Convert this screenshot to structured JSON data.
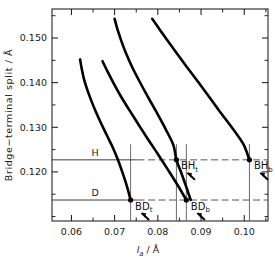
{
  "chart_data": {
    "type": "line",
    "title": "",
    "xlabel": "l_a / Å",
    "ylabel": "Bridge−terminal split / Å",
    "xlim": [
      0.0555,
      0.1055
    ],
    "ylim": [
      0.109,
      0.1565
    ],
    "grid": false,
    "legend": "none",
    "xticks": [
      0.06,
      0.07,
      0.08,
      0.09,
      0.1
    ],
    "xtick_labels": [
      "0.06",
      "0.07",
      "0.08",
      "0.09",
      "0.10"
    ],
    "yticks": [
      0.12,
      0.13,
      0.14,
      0.15
    ],
    "ytick_labels": [
      "0.120",
      "0.130",
      "0.140",
      "0.150"
    ],
    "series": [
      {
        "name": "curve-1",
        "points": [
          [
            0.062,
            0.1452
          ],
          [
            0.0624,
            0.143
          ],
          [
            0.0629,
            0.1408
          ],
          [
            0.0636,
            0.1386
          ],
          [
            0.0645,
            0.1362
          ],
          [
            0.0656,
            0.1336
          ],
          [
            0.0668,
            0.131
          ],
          [
            0.0682,
            0.1282
          ],
          [
            0.0696,
            0.1254
          ],
          [
            0.0708,
            0.1226
          ],
          [
            0.0719,
            0.1196
          ],
          [
            0.0729,
            0.1166
          ],
          [
            0.0737,
            0.1137
          ]
        ]
      },
      {
        "name": "curve-2",
        "points": [
          [
            0.0672,
            0.1448
          ],
          [
            0.0684,
            0.1424
          ],
          [
            0.0698,
            0.1398
          ],
          [
            0.0714,
            0.137
          ],
          [
            0.0733,
            0.134
          ],
          [
            0.0754,
            0.1308
          ],
          [
            0.0776,
            0.1275
          ],
          [
            0.08,
            0.124
          ],
          [
            0.0824,
            0.1204
          ],
          [
            0.0846,
            0.117
          ],
          [
            0.0866,
            0.1137
          ]
        ]
      },
      {
        "name": "curve-3",
        "points": [
          [
            0.07,
            0.1543
          ],
          [
            0.0707,
            0.1518
          ],
          [
            0.0716,
            0.1492
          ],
          [
            0.0727,
            0.1464
          ],
          [
            0.0741,
            0.1434
          ],
          [
            0.0758,
            0.1402
          ],
          [
            0.0777,
            0.1368
          ],
          [
            0.0798,
            0.1332
          ],
          [
            0.0818,
            0.1296
          ],
          [
            0.0836,
            0.126
          ],
          [
            0.0843,
            0.1227
          ],
          [
            0.0855,
            0.1196
          ],
          [
            0.0866,
            0.1166
          ],
          [
            0.0876,
            0.1137
          ]
        ]
      },
      {
        "name": "curve-4",
        "points": [
          [
            0.0787,
            0.1543
          ],
          [
            0.0805,
            0.1518
          ],
          [
            0.0824,
            0.1492
          ],
          [
            0.0845,
            0.1464
          ],
          [
            0.0868,
            0.1434
          ],
          [
            0.0893,
            0.1402
          ],
          [
            0.0919,
            0.1368
          ],
          [
            0.0946,
            0.1332
          ],
          [
            0.0974,
            0.1296
          ],
          [
            0.0998,
            0.1262
          ],
          [
            0.1012,
            0.1227
          ]
        ]
      }
    ],
    "reference_lines": [
      {
        "label": "H",
        "y": 0.1227,
        "label_x": 0.0655,
        "solid_to": 0.0753
      },
      {
        "label": "D",
        "y": 0.1137,
        "label_x": 0.0655,
        "solid_to": 0.0753
      }
    ],
    "annotations": [
      {
        "name": "BHt",
        "base": "BH",
        "subscript": "t",
        "x": 0.0843,
        "y": 0.1227
      },
      {
        "name": "BHb",
        "base": "BH",
        "subscript": "b",
        "x": 0.1012,
        "y": 0.1227
      },
      {
        "name": "BDt",
        "base": "BD",
        "subscript": "t",
        "x": 0.0737,
        "y": 0.1137
      },
      {
        "name": "BDb",
        "base": "BD",
        "subscript": "b",
        "x": 0.0866,
        "y": 0.1137
      }
    ],
    "drop_lines": [
      0.0737,
      0.0843,
      0.0866,
      0.1012
    ],
    "colors": {
      "axis": "#111111",
      "curve": "#000000",
      "reference": "#4d4d4d"
    }
  },
  "axes": {
    "x": {
      "title_base": "l",
      "title_sub": "a",
      "title_unit": "/ Å"
    },
    "y": {
      "title": "Bridge−terminal split / Å"
    }
  }
}
